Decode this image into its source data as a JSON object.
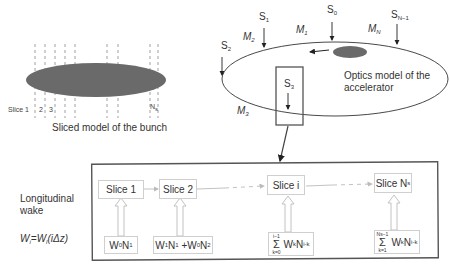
{
  "bunch_panel": {
    "caption": "Sliced model of the bunch",
    "slice_labels": [
      "Slice 1",
      "2",
      "3",
      "N",
      "s"
    ],
    "bunch_color": "#6a6a6a"
  },
  "accelerator_panel": {
    "caption_line1": "Optics model of the",
    "caption_line2": "accelerator",
    "sections": [
      {
        "name": "S",
        "sub": "0"
      },
      {
        "name": "S",
        "sub": "1"
      },
      {
        "name": "S",
        "sub": "2"
      },
      {
        "name": "S",
        "sub": "3"
      },
      {
        "name": "S",
        "sub": "N−1"
      }
    ],
    "maps": [
      {
        "name": "M",
        "sub": "1"
      },
      {
        "name": "M",
        "sub": "2"
      },
      {
        "name": "M",
        "sub": "3"
      },
      {
        "name": "M",
        "sub": "N"
      }
    ]
  },
  "wake_panel": {
    "label_line1": "Longitudinal",
    "label_line2": "wake",
    "formula_lhs": "W",
    "formula_lhs_sub": "i",
    "formula_rhs": "=W",
    "formula_rhs_sub": "l",
    "formula_arg": "(iΔz)",
    "slices": [
      {
        "label": "Slice 1"
      },
      {
        "label": "Slice 2"
      },
      {
        "label": "Slice i"
      },
      {
        "label": "Slice N",
        "sub": "s"
      }
    ],
    "kicks": [
      {
        "text": "W0N1"
      },
      {
        "text": "W1N1 +W0N2"
      },
      {
        "sum_upper": "i−1",
        "sum_lower": "k=0",
        "term": "WkNi-k"
      },
      {
        "sum_upper": "Ns−1",
        "sum_lower": "k=1",
        "term": "WkNi-k"
      }
    ]
  }
}
